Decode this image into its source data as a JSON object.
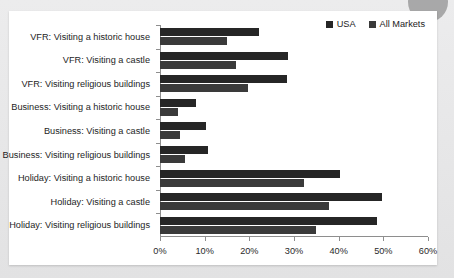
{
  "card": {
    "title": ""
  },
  "legend": {
    "position": "top-right",
    "items": [
      {
        "label": "USA",
        "color": "#262626",
        "swatch_name": "legend-swatch-usa"
      },
      {
        "label": "All Markets",
        "color": "#3a3a3a",
        "swatch_name": "legend-swatch-all-markets"
      }
    ]
  },
  "decor": {
    "corner_circle_color": "#9c9c9c",
    "page_background": "#e8e8e8",
    "card_background": "#ffffff"
  },
  "chart_data": {
    "type": "bar",
    "orientation": "horizontal",
    "title": "",
    "xlabel": "",
    "ylabel": "",
    "xlim": [
      0,
      60
    ],
    "xticks": [
      0,
      10,
      20,
      30,
      40,
      50,
      60
    ],
    "xtick_labels": [
      "0%",
      "10%",
      "20%",
      "30%",
      "40%",
      "50%",
      "60%"
    ],
    "grid": false,
    "legend_position": "top-right",
    "categories": [
      "VFR: Visiting a historic house",
      "VFR: Visiting a castle",
      "VFR: Visiting religious buildings",
      "Business: Visiting a historic house",
      "Business: Visiting a castle",
      "Business: Visiting religious buildings",
      "Holiday: Visiting a historic house",
      "Holiday: Visiting a castle",
      "Holiday: Visiting religious buildings"
    ],
    "series": [
      {
        "name": "USA",
        "color": "#262626",
        "values": [
          22.2,
          28.7,
          28.4,
          8.0,
          10.3,
          10.8,
          40.4,
          49.8,
          48.5
        ]
      },
      {
        "name": "All Markets",
        "color": "#3a3a3a",
        "values": [
          15.0,
          17.0,
          19.7,
          4.0,
          4.5,
          5.7,
          32.3,
          37.8,
          35.0
        ]
      }
    ]
  }
}
